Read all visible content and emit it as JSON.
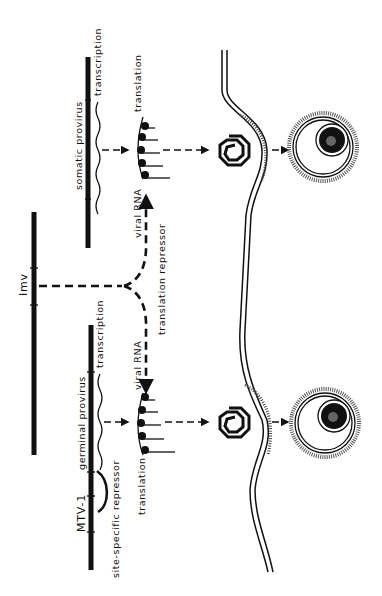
{
  "figure": {
    "colors": {
      "ink": "#111111",
      "background": "#ffffff"
    }
  },
  "labels": {
    "somatic_provirus": "somatic provirus",
    "transcription_top": "transcription",
    "translation_top": "translation",
    "viral_rna_top": "viral RNA",
    "lmv": "Imv",
    "translation_repressor": "translation repressor",
    "germinal_provirus": "germinal provirus",
    "transcription_bottom": "transcription",
    "viral_rna_bottom": "viral RNA",
    "translation_bottom": "translation",
    "mtv1": "MTV-1",
    "site_specific_repressor": "site-specific repressor"
  },
  "icons": {
    "polysome": "ribosome-polysome-icon",
    "core": "spiral-core-icon",
    "bud": "membrane-bud-icon",
    "virion": "virion-particle-icon"
  }
}
